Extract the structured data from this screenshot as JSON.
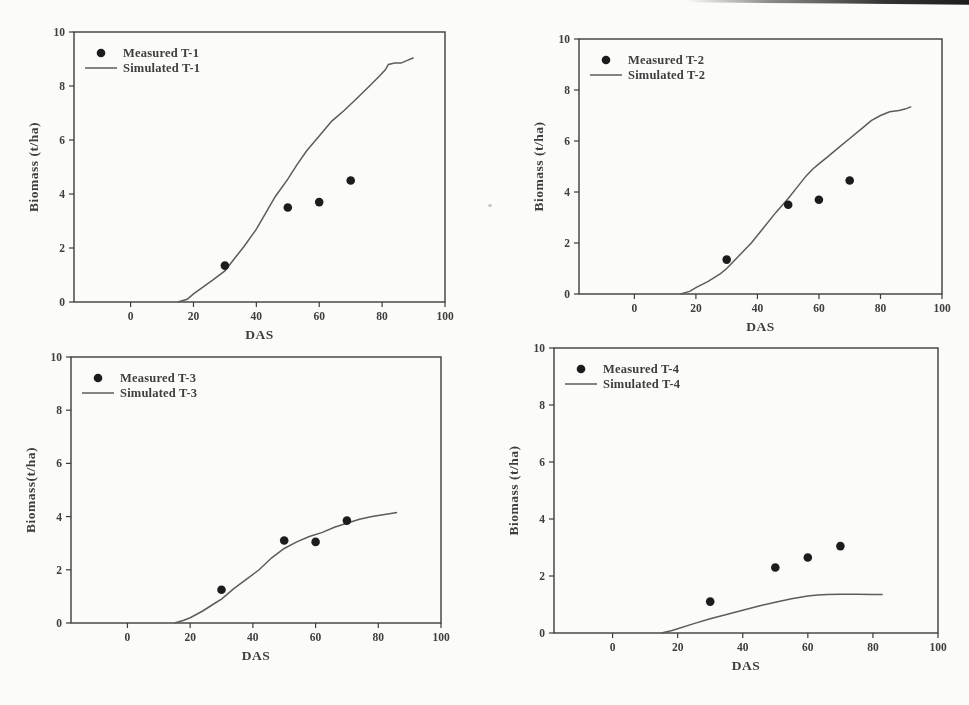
{
  "page": {
    "background": "#fbfbf9"
  },
  "colors": {
    "marker": "#1c1c1c",
    "line": "#5c5c5c",
    "axis": "#3c3c3c",
    "text": "#3e3e3e"
  },
  "chart_data": [
    {
      "type": "line",
      "treatment": "T-1",
      "legend": [
        "Measured T-1",
        "Simulated T-1"
      ],
      "legend_position": "top-left-inside",
      "xlabel": "DAS",
      "ylabel": "Biomass (t/ha)",
      "xlim": [
        -18,
        100
      ],
      "ylim": [
        0,
        10
      ],
      "xticks": [
        0,
        20,
        40,
        60,
        80,
        100
      ],
      "yticks": [
        0,
        2,
        4,
        6,
        8,
        10
      ],
      "grid": false,
      "measured": [
        [
          30,
          1.35
        ],
        [
          50,
          3.5
        ],
        [
          60,
          3.7
        ],
        [
          70,
          4.5
        ]
      ],
      "simulated": [
        [
          15,
          0
        ],
        [
          18,
          0.1
        ],
        [
          20,
          0.3
        ],
        [
          23,
          0.55
        ],
        [
          26,
          0.8
        ],
        [
          30,
          1.15
        ],
        [
          33,
          1.6
        ],
        [
          36,
          2.05
        ],
        [
          40,
          2.7
        ],
        [
          43,
          3.3
        ],
        [
          46,
          3.9
        ],
        [
          50,
          4.55
        ],
        [
          53,
          5.1
        ],
        [
          56,
          5.6
        ],
        [
          60,
          6.15
        ],
        [
          64,
          6.7
        ],
        [
          68,
          7.1
        ],
        [
          72,
          7.55
        ],
        [
          76,
          8.0
        ],
        [
          79,
          8.35
        ],
        [
          81,
          8.6
        ],
        [
          82,
          8.8
        ],
        [
          84,
          8.85
        ],
        [
          86,
          8.85
        ],
        [
          88,
          8.95
        ],
        [
          90,
          9.05
        ]
      ]
    },
    {
      "type": "line",
      "treatment": "T-2",
      "legend": [
        "Measured T-2",
        "Simulated T-2"
      ],
      "legend_position": "top-left-inside",
      "xlabel": "DAS",
      "ylabel": "Biomass (t/ha)",
      "xlim": [
        -18,
        100
      ],
      "ylim": [
        0,
        10
      ],
      "xticks": [
        0,
        20,
        40,
        60,
        80,
        100
      ],
      "yticks": [
        0,
        2,
        4,
        6,
        8,
        10
      ],
      "grid": false,
      "measured": [
        [
          30,
          1.35
        ],
        [
          50,
          3.5
        ],
        [
          60,
          3.7
        ],
        [
          70,
          4.45
        ]
      ],
      "simulated": [
        [
          15,
          0
        ],
        [
          18,
          0.1
        ],
        [
          20,
          0.25
        ],
        [
          24,
          0.5
        ],
        [
          28,
          0.8
        ],
        [
          30,
          1.0
        ],
        [
          34,
          1.5
        ],
        [
          38,
          2.0
        ],
        [
          42,
          2.6
        ],
        [
          46,
          3.2
        ],
        [
          50,
          3.75
        ],
        [
          53,
          4.2
        ],
        [
          56,
          4.65
        ],
        [
          58,
          4.9
        ],
        [
          60,
          5.1
        ],
        [
          63,
          5.4
        ],
        [
          66,
          5.7
        ],
        [
          70,
          6.1
        ],
        [
          74,
          6.5
        ],
        [
          77,
          6.8
        ],
        [
          80,
          7.0
        ],
        [
          83,
          7.15
        ],
        [
          86,
          7.2
        ],
        [
          88,
          7.25
        ],
        [
          90,
          7.35
        ]
      ]
    },
    {
      "type": "line",
      "treatment": "T-3",
      "legend": [
        "Measured T-3",
        "Simulated T-3"
      ],
      "legend_position": "top-left-inside",
      "xlabel": "DAS",
      "ylabel": "Biomass(t/ha)",
      "xlim": [
        -18,
        100
      ],
      "ylim": [
        0,
        10
      ],
      "xticks": [
        0,
        20,
        40,
        60,
        80,
        100
      ],
      "yticks": [
        0,
        2,
        4,
        6,
        8,
        10
      ],
      "grid": false,
      "measured": [
        [
          30,
          1.25
        ],
        [
          50,
          3.1
        ],
        [
          60,
          3.05
        ],
        [
          70,
          3.85
        ]
      ],
      "simulated": [
        [
          15,
          0
        ],
        [
          18,
          0.1
        ],
        [
          20,
          0.2
        ],
        [
          24,
          0.45
        ],
        [
          28,
          0.75
        ],
        [
          30,
          0.9
        ],
        [
          34,
          1.3
        ],
        [
          38,
          1.65
        ],
        [
          42,
          2.0
        ],
        [
          46,
          2.45
        ],
        [
          50,
          2.8
        ],
        [
          54,
          3.05
        ],
        [
          58,
          3.25
        ],
        [
          62,
          3.4
        ],
        [
          66,
          3.6
        ],
        [
          70,
          3.75
        ],
        [
          74,
          3.9
        ],
        [
          78,
          4.0
        ],
        [
          82,
          4.08
        ],
        [
          86,
          4.15
        ]
      ]
    },
    {
      "type": "line",
      "treatment": "T-4",
      "legend": [
        "Measured T-4",
        "Simulated T-4"
      ],
      "legend_position": "top-left-inside",
      "xlabel": "DAS",
      "ylabel": "Biomass (t/ha)",
      "xlim": [
        -18,
        100
      ],
      "ylim": [
        0,
        10
      ],
      "xticks": [
        0,
        20,
        40,
        60,
        80,
        100
      ],
      "yticks": [
        0,
        2,
        4,
        6,
        8,
        10
      ],
      "grid": false,
      "measured": [
        [
          30,
          1.1
        ],
        [
          50,
          2.3
        ],
        [
          60,
          2.65
        ],
        [
          70,
          3.05
        ]
      ],
      "simulated": [
        [
          15,
          0
        ],
        [
          18,
          0.08
        ],
        [
          20,
          0.15
        ],
        [
          25,
          0.33
        ],
        [
          30,
          0.5
        ],
        [
          35,
          0.65
        ],
        [
          40,
          0.8
        ],
        [
          45,
          0.95
        ],
        [
          50,
          1.08
        ],
        [
          55,
          1.2
        ],
        [
          60,
          1.3
        ],
        [
          63,
          1.33
        ],
        [
          66,
          1.35
        ],
        [
          70,
          1.36
        ],
        [
          75,
          1.36
        ],
        [
          80,
          1.35
        ],
        [
          83,
          1.35
        ]
      ]
    }
  ]
}
